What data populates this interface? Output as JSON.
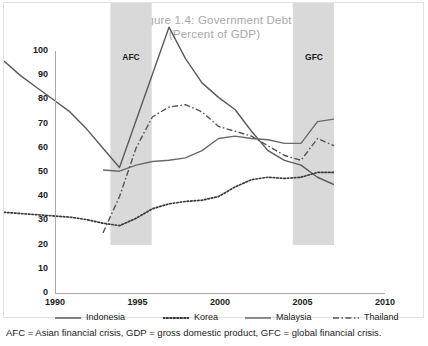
{
  "figure": {
    "title_line1": "Figure 1.4: Government Debt",
    "title_line2": "(Percent of GDP)",
    "footnote": "AFC = Asian financial crisis, GDP = gross domestic product, GFC = global financial crisis."
  },
  "chart_data": {
    "type": "line",
    "title": "Figure 1.4: Government Debt (Percent of GDP)",
    "xlabel": "",
    "ylabel": "",
    "xlim": [
      1990,
      2010
    ],
    "ylim": [
      0,
      100
    ],
    "yticks": [
      0,
      10,
      20,
      30,
      40,
      50,
      60,
      70,
      80,
      90,
      100
    ],
    "xticks": [
      1990,
      1995,
      2000,
      2005,
      2010
    ],
    "grid": false,
    "legend_position": "below-axis",
    "annotations": [
      {
        "label": "AFC",
        "type": "shaded-band",
        "x_start": 1996.5,
        "x_end": 1999.0,
        "color": "#d9d9d9"
      },
      {
        "label": "GFC",
        "type": "shaded-band",
        "x_start": 2007.5,
        "x_end": 2010.0,
        "color": "#d9d9d9"
      }
    ],
    "series": [
      {
        "name": "Indonesia",
        "style": "solid",
        "color": "#5a5a5a",
        "x": [
          1990,
          1991,
          1992,
          1993,
          1994,
          1995,
          1996,
          1997,
          2000,
          2001,
          2002,
          2003,
          2004,
          2005,
          2006,
          2007,
          2008,
          2009,
          2010
        ],
        "values": [
          76,
          70,
          65,
          60,
          55,
          48,
          40,
          32,
          90,
          77,
          67,
          61,
          56,
          47,
          39,
          35,
          33,
          28,
          25
        ]
      },
      {
        "name": "Korea",
        "style": "dotted",
        "color": "#3a3a3a",
        "x": [
          1990,
          1991,
          1992,
          1993,
          1994,
          1995,
          1996,
          1997,
          1998,
          1999,
          2000,
          2001,
          2002,
          2003,
          2004,
          2005,
          2006,
          2007,
          2008,
          2009,
          2010
        ],
        "values": [
          13.5,
          13,
          12.5,
          12,
          11.5,
          10.5,
          9,
          8,
          11,
          15,
          17,
          18,
          18.5,
          20,
          24,
          27,
          28,
          27.5,
          28,
          30,
          30
        ]
      },
      {
        "name": "Malaysia",
        "style": "solid",
        "color": "#6a6a6a",
        "x": [
          1996,
          1997,
          1998,
          1999,
          2000,
          2001,
          2002,
          2003,
          2004,
          2005,
          2006,
          2007,
          2008,
          2009,
          2010
        ],
        "values": [
          31,
          30.5,
          33,
          34.5,
          35,
          36,
          39,
          44,
          45,
          44,
          43.5,
          42,
          42,
          51,
          52
        ]
      },
      {
        "name": "Thailand",
        "style": "dashdot",
        "color": "#555555",
        "x": [
          1996,
          1997,
          1998,
          1999,
          2000,
          2001,
          2002,
          2003,
          2004,
          2005,
          2006,
          2007,
          2008,
          2009,
          2010
        ],
        "values": [
          5,
          20,
          40,
          53,
          57,
          58,
          55,
          49,
          47,
          45,
          41,
          37,
          35,
          44,
          41
        ]
      }
    ]
  },
  "axes": {
    "y_ticks": [
      "100",
      "90",
      "80",
      "70",
      "60",
      "50",
      "40",
      "30",
      "20",
      "10",
      "0"
    ],
    "x_ticks": [
      "1990",
      "1995",
      "2000",
      "2005",
      "2010"
    ]
  },
  "bands": {
    "afc_label": "AFC",
    "gfc_label": "GFC"
  },
  "legend": {
    "items": [
      {
        "label": "Indonesia",
        "style": "solid"
      },
      {
        "label": "Korea",
        "style": "dotted"
      },
      {
        "label": "Malaysia",
        "style": "solid"
      },
      {
        "label": "Thailand",
        "style": "dashdot"
      }
    ]
  }
}
